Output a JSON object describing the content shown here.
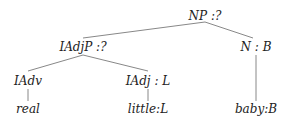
{
  "diagram": {
    "type": "parse-tree",
    "nodes": [
      {
        "id": "np",
        "label": "NP :?",
        "x": 205,
        "y": 10
      },
      {
        "id": "iadjp",
        "label": "IAdjP :?",
        "x": 83,
        "y": 40
      },
      {
        "id": "n",
        "label": "N : B",
        "x": 256,
        "y": 40
      },
      {
        "id": "iadv",
        "label": "IAdv",
        "x": 28,
        "y": 75
      },
      {
        "id": "iadj",
        "label": "IAdj : L",
        "x": 148,
        "y": 75
      },
      {
        "id": "real",
        "label": "real",
        "x": 28,
        "y": 103
      },
      {
        "id": "little",
        "label": "little:L",
        "x": 148,
        "y": 103
      },
      {
        "id": "baby",
        "label": "baby:B",
        "x": 256,
        "y": 103
      }
    ],
    "edges": [
      [
        "np",
        "iadjp"
      ],
      [
        "np",
        "n"
      ],
      [
        "iadjp",
        "iadv"
      ],
      [
        "iadjp",
        "iadj"
      ],
      [
        "iadv",
        "real"
      ],
      [
        "iadj",
        "little"
      ],
      [
        "n",
        "baby"
      ]
    ],
    "line_color": "#888888",
    "text_color": "#222222"
  }
}
